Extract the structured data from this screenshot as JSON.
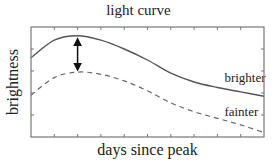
{
  "chart_data": {
    "type": "line",
    "title": "light curve",
    "xlabel": "days since peak",
    "ylabel": "brightness",
    "xlim": [
      0,
      10
    ],
    "ylim": [
      0,
      5
    ],
    "x_ticks": [
      1,
      2,
      3,
      4,
      5,
      6,
      7,
      8,
      9
    ],
    "y_ticks": [
      1,
      2,
      3,
      4
    ],
    "tick_labels_shown": false,
    "grid": false,
    "legend": "inline labels at right",
    "x": [
      0,
      1,
      2,
      3,
      4,
      5,
      6,
      7,
      8,
      9,
      10
    ],
    "series": [
      {
        "name": "brighter",
        "style": "solid",
        "values": [
          3.6,
          4.4,
          4.6,
          4.4,
          4.0,
          3.5,
          2.9,
          2.5,
          2.25,
          2.05,
          1.85
        ]
      },
      {
        "name": "fainter",
        "style": "dashed",
        "values": [
          1.9,
          2.7,
          2.95,
          2.85,
          2.55,
          2.1,
          1.55,
          1.15,
          0.85,
          0.55,
          0.2
        ]
      }
    ],
    "annotations": [
      {
        "type": "double-arrow",
        "x": 2,
        "y_from": 2.95,
        "y_to": 4.6,
        "note": "vertical arrow between peaks"
      },
      {
        "type": "text",
        "text": "brighter",
        "x": 8.3,
        "y": 2.5
      },
      {
        "type": "text",
        "text": "fainter",
        "x": 8.3,
        "y": 0.95
      }
    ]
  },
  "colors": {
    "line": "#555555",
    "frame": "#777777",
    "text": "#222222"
  }
}
